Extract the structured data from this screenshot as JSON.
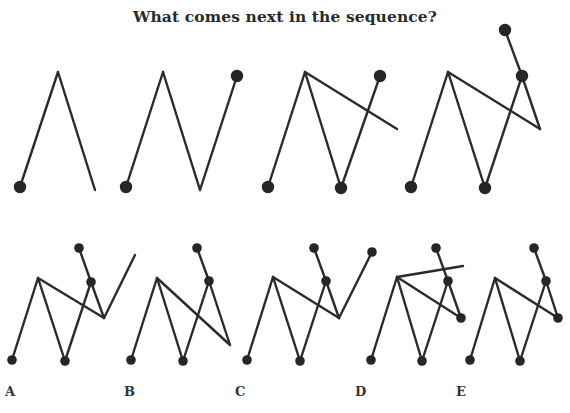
{
  "title": "What comes next in the sequence?",
  "colors": {
    "stroke": "#2b2b2b",
    "dot": "#262626",
    "background": "#ffffff"
  },
  "sequence": [
    {
      "name": "sequence-figure-1",
      "lines": [
        [
          20,
          187,
          58,
          72
        ],
        [
          58,
          72,
          95,
          190
        ]
      ],
      "dots": [
        [
          20,
          187
        ]
      ]
    },
    {
      "name": "sequence-figure-2",
      "lines": [
        [
          126,
          187,
          163,
          72
        ],
        [
          163,
          72,
          200,
          190
        ],
        [
          200,
          190,
          237,
          76
        ]
      ],
      "dots": [
        [
          126,
          187
        ],
        [
          237,
          76
        ]
      ]
    },
    {
      "name": "sequence-figure-3",
      "lines": [
        [
          268,
          187,
          305,
          72
        ],
        [
          305,
          72,
          341,
          188
        ],
        [
          341,
          188,
          380,
          76
        ],
        [
          305,
          72,
          397,
          129
        ]
      ],
      "dots": [
        [
          268,
          187
        ],
        [
          341,
          188
        ],
        [
          380,
          76
        ]
      ]
    },
    {
      "name": "sequence-figure-4",
      "lines": [
        [
          411,
          187,
          448,
          72
        ],
        [
          448,
          72,
          485,
          188
        ],
        [
          485,
          188,
          522,
          76
        ],
        [
          448,
          72,
          540,
          129
        ],
        [
          540,
          129,
          522,
          76
        ],
        [
          522,
          76,
          505,
          30
        ]
      ],
      "dots": [
        [
          411,
          187
        ],
        [
          485,
          188
        ],
        [
          522,
          76
        ],
        [
          505,
          30
        ]
      ]
    }
  ],
  "options": [
    {
      "label": "A",
      "label_x": 5,
      "lines": [
        [
          12,
          360,
          38,
          278
        ],
        [
          38,
          278,
          65,
          361
        ],
        [
          65,
          361,
          91,
          282
        ],
        [
          38,
          278,
          104,
          318
        ],
        [
          104,
          318,
          91,
          282
        ],
        [
          91,
          282,
          79,
          248
        ],
        [
          104,
          318,
          135,
          255
        ]
      ],
      "dots": [
        [
          12,
          360
        ],
        [
          65,
          361
        ],
        [
          91,
          282
        ],
        [
          79,
          248
        ]
      ]
    },
    {
      "label": "B",
      "label_x": 124,
      "lines": [
        [
          131,
          360,
          157,
          278
        ],
        [
          157,
          278,
          183,
          361
        ],
        [
          183,
          361,
          209,
          281
        ],
        [
          157,
          278,
          230,
          345
        ],
        [
          230,
          345,
          209,
          281
        ],
        [
          209,
          281,
          197,
          248
        ]
      ],
      "dots": [
        [
          131,
          360
        ],
        [
          183,
          361
        ],
        [
          209,
          281
        ],
        [
          197,
          248
        ]
      ]
    },
    {
      "label": "C",
      "label_x": 235,
      "lines": [
        [
          247,
          360,
          273,
          277
        ],
        [
          273,
          277,
          300,
          361
        ],
        [
          300,
          361,
          326,
          281
        ],
        [
          273,
          277,
          339,
          318
        ],
        [
          339,
          318,
          326,
          281
        ],
        [
          326,
          281,
          314,
          248
        ],
        [
          339,
          318,
          372,
          252
        ]
      ],
      "dots": [
        [
          247,
          360
        ],
        [
          300,
          361
        ],
        [
          326,
          281
        ],
        [
          314,
          248
        ],
        [
          372,
          252
        ]
      ]
    },
    {
      "label": "D",
      "label_x": 355,
      "lines": [
        [
          371,
          360,
          397,
          277
        ],
        [
          397,
          277,
          422,
          361
        ],
        [
          422,
          361,
          448,
          281
        ],
        [
          397,
          277,
          461,
          318
        ],
        [
          461,
          318,
          448,
          281
        ],
        [
          448,
          281,
          436,
          248
        ],
        [
          397,
          277,
          463,
          266
        ]
      ],
      "dots": [
        [
          371,
          360
        ],
        [
          422,
          361
        ],
        [
          448,
          281
        ],
        [
          436,
          248
        ],
        [
          461,
          318
        ]
      ]
    },
    {
      "label": "E",
      "label_x": 456,
      "lines": [
        [
          470,
          360,
          495,
          278
        ],
        [
          495,
          278,
          520,
          361
        ],
        [
          520,
          361,
          546,
          281
        ],
        [
          495,
          278,
          558,
          318
        ],
        [
          558,
          318,
          546,
          281
        ],
        [
          546,
          281,
          534,
          248
        ]
      ],
      "dots": [
        [
          470,
          360
        ],
        [
          520,
          361
        ],
        [
          546,
          281
        ],
        [
          534,
          248
        ],
        [
          558,
          318
        ]
      ]
    }
  ]
}
